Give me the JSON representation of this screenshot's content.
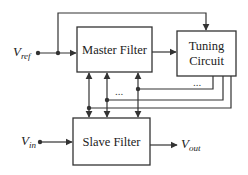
{
  "diagram": {
    "blocks": {
      "master": {
        "label": "Master Filter"
      },
      "tuning": {
        "line1": "Tuning",
        "line2": "Circuit"
      },
      "slave": {
        "label": "Slave Filter"
      }
    },
    "signals": {
      "vref": {
        "main": "V",
        "sub": "ref"
      },
      "vin": {
        "main": "V",
        "sub": "in"
      },
      "vout": {
        "main": "V",
        "sub": "out"
      }
    },
    "ellipsis": {
      "bus_left": "...",
      "bus_right": "..."
    },
    "colors": {
      "stroke": "#333333",
      "background": "#ffffff"
    }
  }
}
